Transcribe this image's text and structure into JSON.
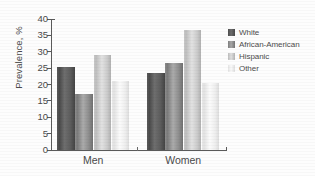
{
  "chart_data": {
    "type": "bar",
    "title": "",
    "subtitle": "",
    "xlabel": "",
    "ylabel": "Prevalence, %",
    "categories": [
      "Men",
      "Women"
    ],
    "series": [
      {
        "name": "White",
        "values": [
          25.5,
          23.5
        ],
        "color": "#5d5d5d"
      },
      {
        "name": "African-American",
        "values": [
          17.0,
          26.5
        ],
        "color": "#8e8e8e"
      },
      {
        "name": "Hispanic",
        "values": [
          29.0,
          36.5
        ],
        "color": "#cbcbcb"
      },
      {
        "name": "Other",
        "values": [
          21.0,
          20.5
        ],
        "color": "#eeeeee"
      }
    ],
    "ylim": [
      0,
      40
    ],
    "yticks": [
      0,
      5,
      10,
      15,
      20,
      25,
      30,
      35,
      40
    ],
    "ytick_labels": [
      "0",
      "5",
      "10",
      "15",
      "20",
      "25",
      "30",
      "35",
      "40"
    ],
    "grid": false,
    "legend_position": "right",
    "annotations": []
  },
  "legend": {
    "items": [
      {
        "label": "White"
      },
      {
        "label": "African-American"
      },
      {
        "label": "Hispanic"
      },
      {
        "label": "Other"
      }
    ]
  },
  "axes": {
    "y_title": "Prevalence, %",
    "x_tick_0": "Men",
    "x_tick_1": "Women"
  }
}
